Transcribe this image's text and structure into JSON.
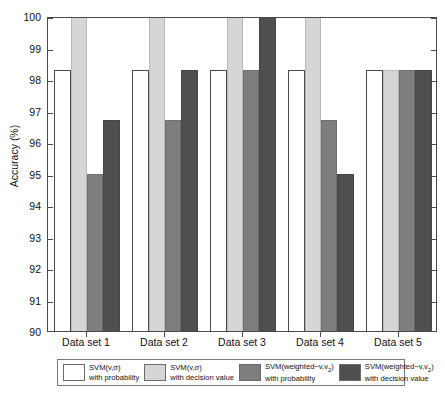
{
  "chart_data": {
    "type": "bar",
    "title": "",
    "xlabel": "",
    "ylabel": "Accuracy (%)",
    "ylim": [
      90,
      100
    ],
    "yticks": [
      90,
      91,
      92,
      93,
      94,
      95,
      96,
      97,
      98,
      99,
      100
    ],
    "ytick_labels": [
      "90",
      "91",
      "92",
      "93",
      "94",
      "95",
      "96",
      "97",
      "98",
      "99",
      "100"
    ],
    "grid": false,
    "legend_position": "below-axis",
    "categories": [
      "Data set 1",
      "Data set 2",
      "Data set 3",
      "Data set 4",
      "Data set 5"
    ],
    "series": [
      {
        "name": "SVM(v,σ) with probability",
        "color": "#ffffff",
        "values": [
          98.3,
          98.3,
          98.3,
          98.3,
          98.3
        ]
      },
      {
        "name": "SVM(v,σ) with decision value",
        "color": "#d6d6d6",
        "values": [
          100,
          100,
          100,
          100,
          98.3
        ]
      },
      {
        "name": "SVM(weighted−v,v2) with probability",
        "color": "#7e7e7e",
        "values": [
          95.0,
          96.7,
          98.3,
          96.7,
          98.3
        ]
      },
      {
        "name": "SVM(weighted−v,v2) with decision value",
        "color": "#4f4f4f",
        "values": [
          96.7,
          98.3,
          100,
          95.0,
          98.3
        ]
      }
    ]
  },
  "axes": {
    "y_title": "Accuracy (%)"
  },
  "legend": {
    "entries": [
      {
        "line1": "SVM(v,σ)",
        "line2": "with probability",
        "swatch": "#ffffff"
      },
      {
        "line1": "SVM(v,σ)",
        "line2": "with decision value",
        "swatch": "#d6d6d6"
      },
      {
        "line1": "SVM(weighted−v,v",
        "sub": "2",
        "line1b": ")",
        "line2": "with probability",
        "swatch": "#7e7e7e"
      },
      {
        "line1": "SVM(weighted−v,v",
        "sub": "2",
        "line1b": ")",
        "line2": "with decision value",
        "swatch": "#4f4f4f"
      }
    ]
  }
}
